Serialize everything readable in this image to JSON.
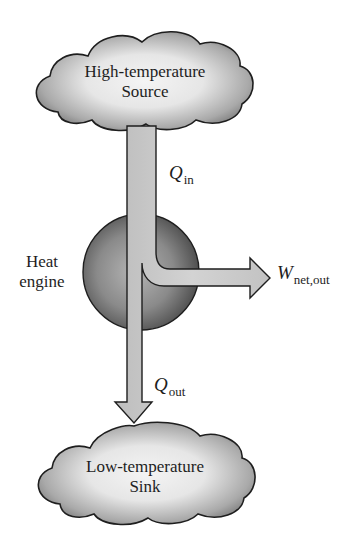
{
  "diagram": {
    "source": {
      "line1": "High-temperature",
      "line2": "Source"
    },
    "sink": {
      "line1": "Low-temperature",
      "line2": "Sink"
    },
    "engine": {
      "line1": "Heat",
      "line2": "engine"
    },
    "q_in": {
      "symbol": "Q",
      "subscript": "in"
    },
    "q_out": {
      "symbol": "Q",
      "subscript": "out"
    },
    "w_net": {
      "symbol": "W",
      "subscript": "net,out"
    },
    "colors": {
      "cloud_light": "#f2f2f2",
      "cloud_dark": "#7a7a7a",
      "sphere_light": "#a8a8a8",
      "sphere_dark": "#4a4a4a",
      "arrow_fill": "#c9c9c9",
      "outline": "#1e1e1e"
    }
  }
}
